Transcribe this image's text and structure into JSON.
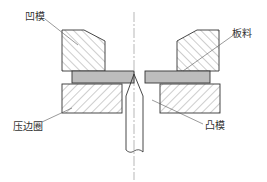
{
  "diagram": {
    "type": "mechanical cross-section",
    "labels": {
      "die": "凹模",
      "sheet": "板料",
      "blank_holder": "压边圈",
      "punch": "凸模"
    },
    "colors": {
      "stroke": "#333333",
      "hatch": "#555555",
      "sheet_fill": "#bdbdbd",
      "background": "#ffffff"
    }
  }
}
